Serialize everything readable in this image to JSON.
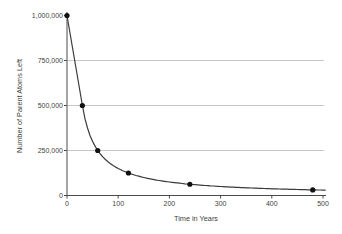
{
  "chart_data": {
    "type": "line",
    "title": "",
    "xlabel": "Time in Years",
    "ylabel": "Number of Parent Atoms Left",
    "xlim": [
      0,
      500
    ],
    "ylim": [
      0,
      1000000
    ],
    "grid": "horizontal",
    "legend_position": "none",
    "gridlines_y": [
      250000,
      500000,
      750000
    ],
    "x_ticks": [
      {
        "value": 0,
        "label": "0"
      },
      {
        "value": 100,
        "label": "100"
      },
      {
        "value": 200,
        "label": "200"
      },
      {
        "value": 300,
        "label": "300"
      },
      {
        "value": 400,
        "label": "400"
      },
      {
        "value": 500,
        "label": "500"
      }
    ],
    "y_ticks": [
      {
        "value": 0,
        "label": "0"
      },
      {
        "value": 250000,
        "label": "250,000"
      },
      {
        "value": 500000,
        "label": "500,000"
      },
      {
        "value": 750000,
        "label": "750,000"
      },
      {
        "value": 1000000,
        "label": "1,000,000"
      }
    ],
    "points": [
      [
        0,
        1000000
      ],
      [
        30,
        500000
      ],
      [
        60,
        250000
      ],
      [
        120,
        125000
      ],
      [
        240,
        62500
      ],
      [
        480,
        31250
      ]
    ],
    "curve_model": {
      "type": "reciprocal",
      "k": 15000000,
      "start_point": [
        0,
        1000000
      ],
      "from_t": 30,
      "to_t": 505
    },
    "colors": {
      "background": "#ffffff",
      "grid": "#c7c7c7",
      "axis": "#4a4a4a",
      "curve": "#3b3b3b",
      "point": "#111111",
      "text": "#3f3f3f"
    }
  }
}
